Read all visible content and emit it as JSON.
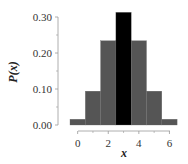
{
  "chart_data": {
    "type": "bar",
    "title": "",
    "xlabel": "x",
    "ylabel": "P(x)",
    "categories": [
      "0",
      "1",
      "2",
      "3",
      "4",
      "5",
      "6"
    ],
    "values": [
      0.016,
      0.094,
      0.234,
      0.313,
      0.234,
      0.094,
      0.016
    ],
    "highlight_index": 3,
    "colors": {
      "bar": "#555555",
      "highlight": "#000000",
      "axis": "#999999"
    },
    "ylim": [
      0,
      0.3
    ],
    "yticks": [
      "0.00",
      "0.10",
      "0.20",
      "0.30"
    ],
    "xticks": [
      "0",
      "2",
      "4",
      "6"
    ],
    "grid": false,
    "legend": null
  }
}
